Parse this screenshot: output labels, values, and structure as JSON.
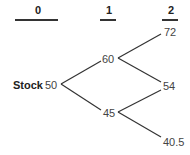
{
  "periods": [
    {
      "label": "0"
    },
    {
      "label": "1"
    },
    {
      "label": "2"
    }
  ],
  "tree": {
    "root_label": "Stock",
    "root": "50",
    "period1": {
      "up": "60",
      "down": "45"
    },
    "period2": {
      "uu": "72",
      "ud": "54",
      "dd": "40.5"
    }
  }
}
